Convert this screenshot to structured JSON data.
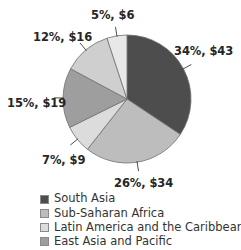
{
  "chart_data": {
    "type": "pie",
    "title": "",
    "subtitle": "",
    "xlabel": "",
    "ylabel": "",
    "grid": false,
    "legend_position": "bottom",
    "center": {
      "x": 127,
      "y": 99
    },
    "radius": 64,
    "start_angle_deg": 0,
    "direction": "clockwise",
    "categories": [
      "South Asia",
      "Sub-Saharan Africa",
      "Latin America and the Caribbean",
      "East Asia and Pacific",
      "",
      ""
    ],
    "values": [
      34,
      26,
      7,
      15,
      12,
      5
    ],
    "amounts": [
      43,
      34,
      9,
      19,
      16,
      6
    ],
    "slices": [
      {
        "label": "34%, $43",
        "percent": 34,
        "amount": 43,
        "color": "#4d4d4d",
        "label_left": 174,
        "label_top": 46,
        "has_leader": true
      },
      {
        "label": "26%, $34",
        "percent": 26,
        "amount": 34,
        "color": "#bdbdbd",
        "label_left": 114,
        "label_top": 178,
        "has_leader": true
      },
      {
        "label": "7%, $9",
        "percent": 7,
        "amount": 9,
        "color": "#dcdcdc",
        "label_left": 42,
        "label_top": 155,
        "has_leader": true
      },
      {
        "label": "15%, $19",
        "percent": 15,
        "amount": 19,
        "color": "#9e9e9e",
        "label_left": 7,
        "label_top": 98,
        "has_leader": true
      },
      {
        "label": "12%, $16",
        "percent": 12,
        "amount": 16,
        "color": "#cfcfcf",
        "label_left": 33,
        "label_top": 32,
        "has_leader": true
      },
      {
        "label": "5%, $6",
        "percent": 5,
        "amount": 6,
        "color": "#e8e8e8",
        "label_left": 91,
        "label_top": 10,
        "has_leader": true
      }
    ]
  },
  "legend": {
    "items": [
      {
        "label": "South Asia",
        "color": "#4d4d4d"
      },
      {
        "label": "Sub-Saharan Africa",
        "color": "#bdbdbd"
      },
      {
        "label": "Latin America and the Caribbean",
        "color": "#dcdcdc"
      },
      {
        "label": "East Asia and Pacific",
        "color": "#9e9e9e"
      }
    ]
  }
}
